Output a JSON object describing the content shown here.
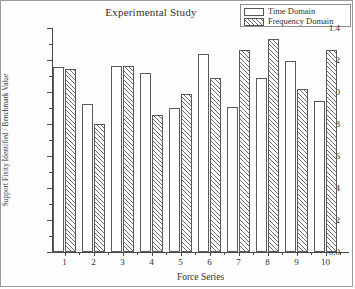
{
  "chart_data": {
    "type": "bar",
    "title": "Experimental Study",
    "xlabel": "Force Series",
    "ylabel": "Support Fixity Identified / Benchmark Value",
    "categories": [
      "1",
      "2",
      "3",
      "4",
      "5",
      "6",
      "7",
      "8",
      "9",
      "10"
    ],
    "series": [
      {
        "name": "Time Domain",
        "values": [
          1.155,
          0.925,
          1.16,
          1.12,
          0.9,
          1.235,
          0.905,
          1.085,
          1.195,
          0.945
        ]
      },
      {
        "name": "Frequency Domain",
        "values": [
          1.145,
          0.8,
          1.16,
          0.855,
          0.99,
          1.09,
          1.265,
          1.33,
          1.02,
          1.265
        ]
      }
    ],
    "ylim": [
      0.0,
      1.4
    ],
    "yticks": [
      "0.0",
      "0.2",
      "0.4",
      "0.6",
      "0.8",
      "1.0",
      "1.2",
      "1.4"
    ],
    "ytick_values": [
      0.0,
      0.2,
      0.4,
      0.6,
      0.8,
      1.0,
      1.2,
      1.4
    ],
    "grid": false,
    "legend_position": "top-right"
  },
  "legend": {
    "entries": [
      {
        "label": "Time Domain",
        "style": "open"
      },
      {
        "label": "Frequency Domain",
        "style": "hatched"
      }
    ]
  }
}
